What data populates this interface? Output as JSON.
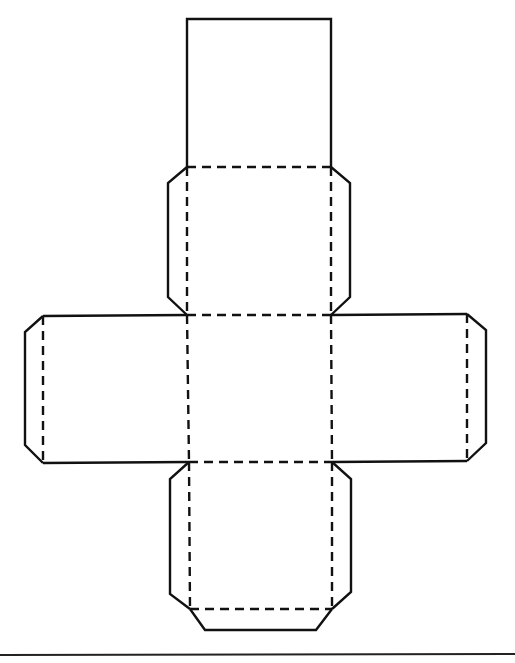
{
  "diagram": {
    "title": "Cube net with glue tabs",
    "type": "cube-net",
    "colors": {
      "line": "#111111",
      "background": "#ffffff"
    },
    "legend": {
      "solid_line": "cut line",
      "dashed_line": "fold line"
    },
    "faces": [
      {
        "id": "top",
        "x": 187,
        "y": 19,
        "w": 144,
        "h": 148
      },
      {
        "id": "upper-middle",
        "x": 187,
        "y": 167,
        "w": 144,
        "h": 148
      },
      {
        "id": "left",
        "x": 43,
        "y": 315,
        "w": 144,
        "h": 148
      },
      {
        "id": "center",
        "x": 187,
        "y": 315,
        "w": 144,
        "h": 148
      },
      {
        "id": "right",
        "x": 331,
        "y": 315,
        "w": 136,
        "h": 148
      },
      {
        "id": "bottom",
        "x": 189,
        "y": 462,
        "w": 143,
        "h": 148
      }
    ],
    "tabs": [
      {
        "id": "upper-middle-left",
        "attached_to": "upper-middle",
        "side": "left"
      },
      {
        "id": "upper-middle-right",
        "attached_to": "upper-middle",
        "side": "right"
      },
      {
        "id": "left-outer",
        "attached_to": "left",
        "side": "left"
      },
      {
        "id": "right-outer",
        "attached_to": "right",
        "side": "right"
      },
      {
        "id": "bottom-left",
        "attached_to": "bottom",
        "side": "left"
      },
      {
        "id": "bottom-right",
        "attached_to": "bottom",
        "side": "right"
      },
      {
        "id": "bottom-bottom",
        "attached_to": "bottom",
        "side": "bottom"
      }
    ]
  }
}
